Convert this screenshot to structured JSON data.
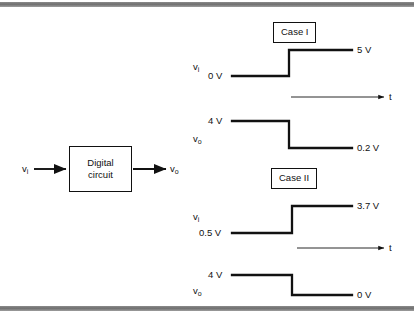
{
  "figure": {
    "type": "timing-diagram",
    "block": {
      "label_line1": "Digital",
      "label_line2": "circuit",
      "input_signal": "v",
      "input_subscript": "i",
      "output_signal": "v",
      "output_subscript": "o"
    },
    "cases": [
      {
        "name": "Case I",
        "time_axis_label": "t",
        "input": {
          "signal": "v",
          "subscript": "i",
          "low_level": "0 V",
          "high_level": "5 V",
          "transition": "low-to-high"
        },
        "output": {
          "signal": "v",
          "subscript": "o",
          "high_level": "4 V",
          "low_level": "0.2 V",
          "transition": "high-to-low"
        }
      },
      {
        "name": "Case II",
        "time_axis_label": "t",
        "input": {
          "signal": "v",
          "subscript": "i",
          "low_level": "0.5 V",
          "high_level": "3.7 V",
          "transition": "low-to-high"
        },
        "output": {
          "signal": "v",
          "subscript": "o",
          "high_level": "4 V",
          "low_level": "0 V",
          "transition": "high-to-low"
        }
      }
    ],
    "colors": {
      "ink": "#111111",
      "rule": "#7a7a7a",
      "background": "#ffffff"
    }
  }
}
